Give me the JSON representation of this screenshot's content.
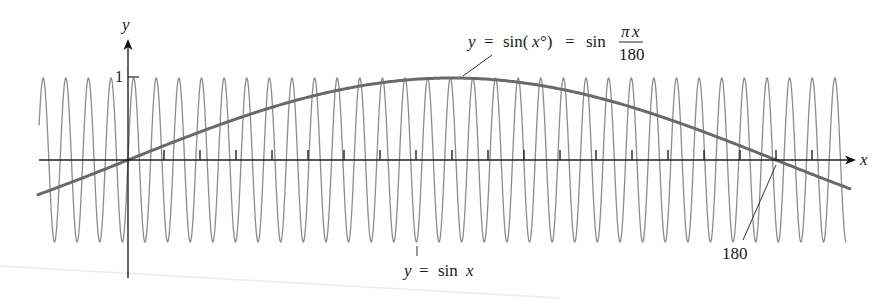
{
  "chart_data": {
    "type": "line",
    "title": "",
    "xlabel": "x",
    "ylabel": "y",
    "xlim": [
      -24.7,
      200.5
    ],
    "ylim": [
      -1,
      1
    ],
    "grid": false,
    "x_ticks_every": 10,
    "y_tick_labels": [
      "1"
    ],
    "x_tick_labels": [
      "180"
    ],
    "series": [
      {
        "name": "y = sin x",
        "function": "sin(x)",
        "x_range": [
          -24.7,
          199.5
        ],
        "color": "#8c8c8c",
        "stroke_width": 1.3
      },
      {
        "name": "y = sin(x°) = sin πx/180",
        "function": "sin(pi*x/180)",
        "x_range": [
          -25,
          200.8
        ],
        "color": "#6a6a6a",
        "stroke_width": 3
      }
    ],
    "annotations": [
      {
        "text": "y = sin(x°) = sin πx/180",
        "target_x": 90,
        "target_y": 1
      },
      {
        "text": "y = sin x",
        "target_x": 80,
        "target_y": -1
      },
      {
        "text": "180",
        "target_x": 180,
        "target_y": 0
      }
    ]
  },
  "labels": {
    "y_axis": "y",
    "x_axis": "x",
    "one": "1",
    "one_eighty": "180",
    "sinx_y": "y",
    "sinx_eq": "=",
    "sinx_fn": "sin",
    "sinx_x": "x",
    "deg_y": "y",
    "deg_eq1": "=",
    "deg_sin1": "sin(",
    "deg_x": "x",
    "deg_circ": "°)",
    "deg_eq2": "=",
    "deg_sin2": "sin",
    "deg_num_pi": "π",
    "deg_num_x": "x",
    "deg_den": "180"
  },
  "layout": {
    "origin_px": [
      128,
      160
    ],
    "px_per_unit_x": 3.6,
    "px_per_unit_y": 82
  }
}
